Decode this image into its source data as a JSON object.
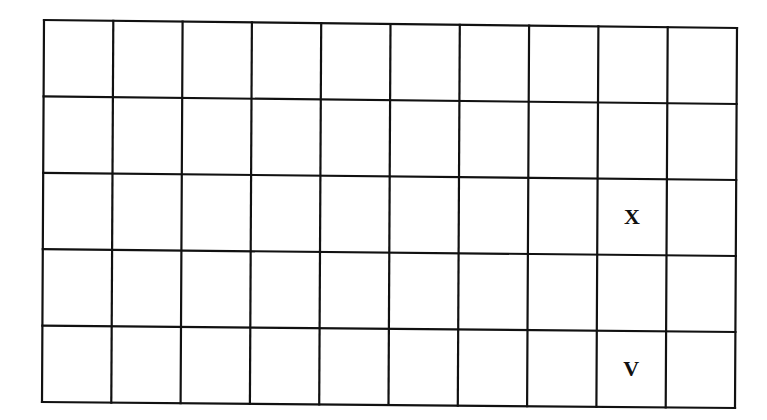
{
  "grid": {
    "rows": 5,
    "cols": 10,
    "line_color": "#111111",
    "background": "#ffffff",
    "corners": {
      "top_left": [
        44,
        20
      ],
      "top_right": [
        737,
        28
      ],
      "bottom_left": [
        42,
        402
      ],
      "bottom_right": [
        735,
        408
      ]
    }
  },
  "cells": [
    {
      "row": 3,
      "col": 9,
      "label": "X"
    },
    {
      "row": 5,
      "col": 9,
      "label": "V"
    }
  ]
}
